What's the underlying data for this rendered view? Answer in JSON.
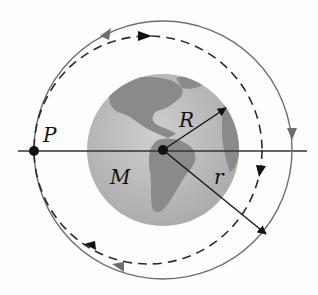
{
  "diagram": {
    "labels": {
      "point": "P",
      "earth_radius": "R",
      "mass": "M",
      "orbit_radius": "r"
    },
    "colors": {
      "earth_land": "#8c8c8c",
      "earth_ocean": "#bdbdbd",
      "orbit_line": "#6e6e6e",
      "dashed_orbit": "#2a2a2a",
      "axis_line": "#333333"
    },
    "geometry": {
      "earth_center": [
        163,
        150
      ],
      "earth_radius_px": 76,
      "solid_orbit_radius_px": 129,
      "dashed_orbit_center": [
        148,
        150
      ],
      "dashed_orbit_radius_px": 114,
      "point_P": [
        34,
        151
      ]
    }
  }
}
